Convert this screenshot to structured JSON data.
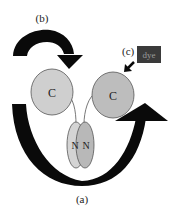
{
  "diagram": {
    "labels": {
      "a": "(a)",
      "b": "(b)",
      "c": "(c)"
    },
    "domains": {
      "c_left": "C",
      "c_right": "C",
      "n_left": "N",
      "n_right": "N"
    },
    "dye_label": "dye",
    "colors": {
      "arrow": "#0a0a0a",
      "c_left_fill": "#cfcfcf",
      "c_right_fill": "#bdbdbd",
      "n_left_fill": "#d4d4d4",
      "n_right_fill": "#b8b8b8",
      "outline": "#555555",
      "dye_box": "#3a3a3a",
      "dye_text": "#9a9a9a"
    }
  }
}
